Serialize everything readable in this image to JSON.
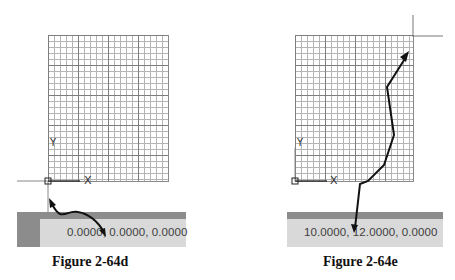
{
  "figures": [
    {
      "id": "left",
      "caption": "Figure 2-64d",
      "axis_x_label": "X",
      "axis_y_label": "Y",
      "status_coordinates": "0.0000, 0.0000, 0.0000",
      "cursor_position": "origin",
      "arrow_target": "coordinate-display"
    },
    {
      "id": "right",
      "caption": "Figure 2-64e",
      "axis_x_label": "X",
      "axis_y_label": "Y",
      "status_coordinates": "10.0000, 12.0000, 0.0000",
      "cursor_position": "top-right-grid-corner",
      "arrow_target": "coordinate-display"
    }
  ],
  "grid": {
    "minor_spacing_units": 1,
    "major_every": 5,
    "columns": 20,
    "rows": 24
  },
  "colors": {
    "grid_minor": "#b4b4b4",
    "grid_major": "#7d7d7d",
    "statusbar_bg": "#d9d9d9",
    "statusbar_dark": "#8c8c8c",
    "arrow": "#111111"
  }
}
